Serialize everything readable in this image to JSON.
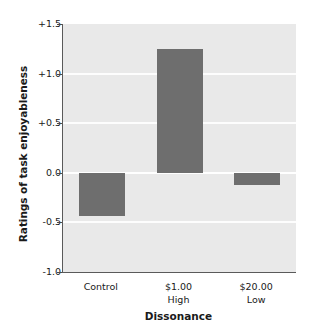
{
  "chart_data": {
    "type": "bar",
    "title": "",
    "xlabel": "Dissonance",
    "ylabel": "Ratings of task enjoyableness",
    "categories": [
      "Control",
      "$1.00\nHigh",
      "$20.00\nLow"
    ],
    "category_lines": [
      {
        "line1": "Control",
        "line2": ""
      },
      {
        "line1": "$1.00",
        "line2": "High"
      },
      {
        "line1": "$20.00",
        "line2": "Low"
      }
    ],
    "values": [
      -0.44,
      1.25,
      -0.12
    ],
    "ylim": [
      -1.0,
      1.5
    ],
    "yticks": [
      1.5,
      1.0,
      0.5,
      0.0,
      -0.5,
      -1.0
    ],
    "ytick_labels": [
      "+1.5",
      "+1.0",
      "+0.5",
      "0.0",
      "-0.5",
      "-1.0"
    ],
    "grid": true,
    "gridlines_at": [
      1.0,
      0.5,
      0.0,
      -0.5
    ],
    "legend": null,
    "legend_position": "none",
    "bar_color": "#6e6e6e",
    "plot_background": "#e9e9e9",
    "gridline_color": "#ffffff",
    "axis_color": "#5a5a5a",
    "text_color": "#1a1a1a",
    "page_background": "#ffffff"
  }
}
